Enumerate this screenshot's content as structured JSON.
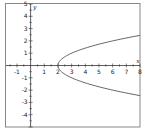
{
  "chart_data": {
    "type": "line",
    "title": "",
    "xlabel": "x",
    "ylabel": "y",
    "xlim": [
      -1.8,
      8
    ],
    "ylim": [
      -5,
      5
    ],
    "grid": false,
    "equation": "x = y^2 + 2",
    "series": [
      {
        "name": "parabola",
        "color": "#555555",
        "points": [
          [
            8,
            -2.449
          ],
          [
            7,
            -2.236
          ],
          [
            6,
            -2
          ],
          [
            5,
            -1.732
          ],
          [
            4,
            -1.414
          ],
          [
            3,
            -1
          ],
          [
            2.5,
            -0.707
          ],
          [
            2.25,
            -0.5
          ],
          [
            2,
            0
          ],
          [
            2.25,
            0.5
          ],
          [
            2.5,
            0.707
          ],
          [
            3,
            1
          ],
          [
            4,
            1.414
          ],
          [
            5,
            1.732
          ],
          [
            6,
            2
          ],
          [
            7,
            2.236
          ],
          [
            8,
            2.449
          ]
        ]
      }
    ],
    "x_ticks": [
      -1,
      1,
      2,
      3,
      4,
      5,
      6,
      7,
      8
    ],
    "y_ticks": [
      -4,
      -3,
      -2,
      -1,
      1,
      2,
      3,
      4,
      5
    ],
    "x_minor_step": 0.5,
    "y_minor_step": 0.5,
    "frame_color": "#888888",
    "axis_color": "#333333"
  }
}
